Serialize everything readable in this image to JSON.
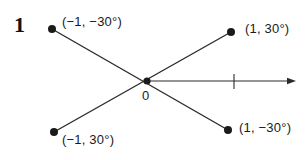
{
  "figure": {
    "number": "1",
    "origin_label": "0",
    "colors": {
      "ink": "#1a1a1a",
      "line": "#2b2b2b",
      "background": "#ffffff"
    },
    "points": [
      {
        "id": "upper-left",
        "label": "(−1, −30°)",
        "x": 52,
        "y": 29,
        "label_x": 62,
        "label_y": 15
      },
      {
        "id": "upper-right",
        "label": "(1, 30°)",
        "x": 231,
        "y": 32,
        "label_x": 245,
        "label_y": 22
      },
      {
        "id": "lower-left",
        "label": "(−1, 30°)",
        "x": 54,
        "y": 132,
        "label_x": 62,
        "label_y": 133
      },
      {
        "id": "lower-right",
        "label": "(1, −30°)",
        "x": 228,
        "y": 130,
        "label_x": 239,
        "label_y": 121
      }
    ],
    "origin": {
      "x": 147,
      "y": 81,
      "label_x": 142,
      "label_y": 89
    },
    "polar_axis": {
      "name": "polar-axis",
      "start_x": 147,
      "start_y": 81,
      "end_x": 296,
      "end_y": 81,
      "tick_x": 234,
      "tick_top_y": 74,
      "tick_bottom_y": 89
    },
    "rays": [
      {
        "id": "ray-upper-left-to-lower-right",
        "x1": 52,
        "y1": 29,
        "x2": 228,
        "y2": 130
      },
      {
        "id": "ray-lower-left-to-upper-right",
        "x1": 54,
        "y1": 132,
        "x2": 231,
        "y2": 32
      }
    ]
  },
  "chart_data": {
    "type": "scatter",
    "title": "",
    "xlabel": "",
    "ylabel": "",
    "points": [
      {
        "label": "(−1, −30°)",
        "r": -1,
        "theta_deg": -30
      },
      {
        "label": "(1, 30°)",
        "r": 1,
        "theta_deg": 30
      },
      {
        "label": "(−1, 30°)",
        "r": -1,
        "theta_deg": 30
      },
      {
        "label": "(1, −30°)",
        "r": 1,
        "theta_deg": -30
      }
    ],
    "pole_label": "0",
    "axis_tick_value": 1,
    "grid": false,
    "legend": null
  }
}
